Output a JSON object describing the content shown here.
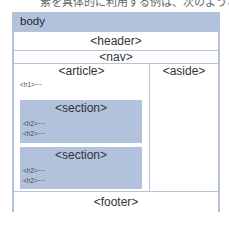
{
  "caption_fragment": "素を具体的に利用する例は、次のようなもの",
  "diagram": {
    "body_label": "body",
    "header_label": "<header>",
    "nav_label": "<nav>",
    "article": {
      "label": "<article>",
      "h1": "<h1>⋯",
      "sections": [
        {
          "label": "<section>",
          "h2s": [
            "<h2>⋯",
            "<h2>⋯"
          ]
        },
        {
          "label": "<section>",
          "h2s": [
            "<h2>⋯",
            "<h2>⋯"
          ]
        }
      ]
    },
    "aside_label": "<aside>",
    "footer_label": "<footer>"
  },
  "colors": {
    "block_blue": "#b3c2dc",
    "border": "#b9c4d6",
    "white": "#ffffff"
  }
}
